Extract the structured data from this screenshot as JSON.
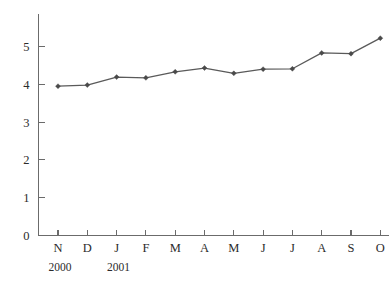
{
  "chart_data": {
    "type": "line",
    "title": "",
    "subtitle": "",
    "xlabel": "",
    "ylabel": "",
    "categories": [
      "N",
      "D",
      "J",
      "F",
      "M",
      "A",
      "M",
      "J",
      "J",
      "A",
      "S",
      "O"
    ],
    "values": [
      3.95,
      3.98,
      4.19,
      4.17,
      4.33,
      4.43,
      4.29,
      4.4,
      4.41,
      4.83,
      4.81,
      5.22
    ],
    "series": [
      {
        "name": "series-1",
        "values": [
          3.95,
          3.98,
          4.19,
          4.17,
          4.33,
          4.43,
          4.29,
          4.4,
          4.41,
          4.83,
          4.81,
          5.22
        ]
      }
    ],
    "ylim": [
      0,
      5.85
    ],
    "y_ticks": [
      0,
      1,
      2,
      3,
      4,
      5
    ],
    "y_tick_labels": [
      "0",
      "1",
      "2",
      "3",
      "4",
      "5"
    ],
    "x_tick_labels": [
      "N",
      "D",
      "J",
      "F",
      "M",
      "A",
      "M",
      "J",
      "J",
      "A",
      "S",
      "O"
    ],
    "grid": false,
    "legend": "none",
    "line_color": "#5a5a5a",
    "marker_color": "#4a4a4a",
    "axis_color": "#6b6b6b",
    "background_color": "#ffffff"
  },
  "axes": {
    "y_tick_labels": [
      "5",
      "4",
      "3",
      "2",
      "1",
      "0"
    ],
    "x_tick_labels": [
      "N",
      "D",
      "J",
      "F",
      "M",
      "A",
      "M",
      "J",
      "J",
      "A",
      "S",
      "O"
    ]
  },
  "year_labels": [
    {
      "text": "2000",
      "category": "N"
    },
    {
      "text": "2001",
      "category": "J"
    }
  ],
  "edge_text": {
    "fragment": "·\n·\n·"
  }
}
